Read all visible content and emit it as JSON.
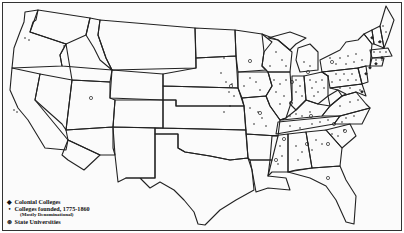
{
  "map": {
    "title": "",
    "legend": [
      {
        "symbol": "◆",
        "name": "colonial-college-symbol",
        "label": "Colonial Colleges"
      },
      {
        "symbol": "•",
        "name": "denominational-college-symbol",
        "label": "Colleges founded, 1775-1860",
        "sublabel": "(Mostly Denominational)"
      },
      {
        "symbol": "⊛",
        "name": "state-university-symbol",
        "label": "State Universities"
      }
    ],
    "colors": {
      "ink": "#222222",
      "paper": "#fbfbfb"
    }
  }
}
